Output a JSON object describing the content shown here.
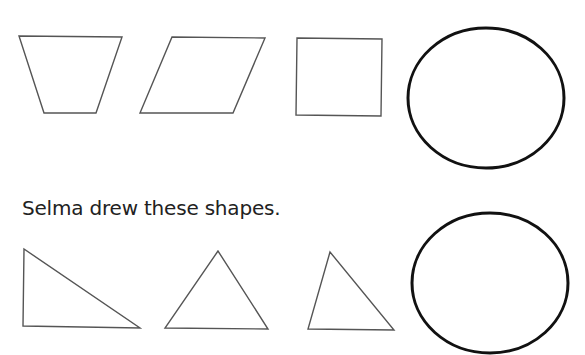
{
  "caption": "Selma drew these shapes.",
  "colors": {
    "background": "#ffffff",
    "polygon_stroke": "#555555",
    "oval_stroke": "#111111",
    "text": "#222222"
  },
  "row_top": {
    "shapes": [
      {
        "type": "trapezoid",
        "points": "19,36 122,37 96,113 44,113"
      },
      {
        "type": "parallelogram",
        "points": "172,37 265,38 233,113 140,113"
      },
      {
        "type": "square",
        "points": "297,38 382,39 381,116 296,115"
      },
      {
        "type": "oval",
        "cx": 486,
        "cy": 98,
        "rx": 78,
        "ry": 70
      }
    ]
  },
  "row_bottom": {
    "shapes": [
      {
        "type": "right-triangle",
        "points": "24,249 23,326 140,328"
      },
      {
        "type": "triangle",
        "points": "218,251 165,328 268,329"
      },
      {
        "type": "scalene-triangle",
        "points": "330,252 308,329 394,330"
      },
      {
        "type": "oval",
        "cx": 490,
        "cy": 283,
        "rx": 78,
        "ry": 70
      }
    ]
  }
}
